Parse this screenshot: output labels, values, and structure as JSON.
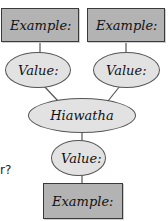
{
  "diagram": {
    "type": "genealogy-tree",
    "colors": {
      "box_fill": "#b3b3b3",
      "box_border": "#3a3a3a",
      "ellipse_fill": "#e2e2e2",
      "ellipse_border": "#555555",
      "connector": "#555555"
    },
    "top_left_box": {
      "label": "Example:"
    },
    "top_right_box": {
      "label": "Example:"
    },
    "left_value": {
      "label": "Value:"
    },
    "right_value": {
      "label": "Value:"
    },
    "center_node": {
      "label": "Hiawatha"
    },
    "bottom_value": {
      "label": "Value:"
    },
    "bottom_box": {
      "label": "Example:"
    },
    "side_text": "r?"
  }
}
